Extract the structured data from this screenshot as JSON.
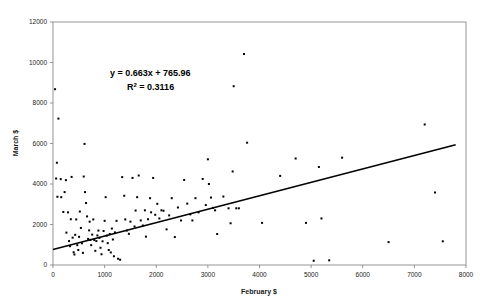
{
  "chart_data": {
    "type": "scatter",
    "title": "",
    "xlabel": "February $",
    "ylabel": "March $",
    "xlim": [
      0,
      8000
    ],
    "ylim": [
      0,
      12000
    ],
    "xticks": [
      0,
      1000,
      2000,
      3000,
      4000,
      5000,
      6000,
      7000,
      8000
    ],
    "yticks": [
      0,
      2000,
      4000,
      6000,
      8000,
      10000,
      12000
    ],
    "grid": false,
    "legend": "none",
    "annotations": {
      "equation": "y = 0.663x + 765.96",
      "r_squared_label": "R",
      "r_squared_exponent": "2",
      "r_squared_value": " = 0.3116"
    },
    "trendline": {
      "type": "linear",
      "slope": 0.663,
      "intercept": 765.96,
      "r_squared": 0.3116,
      "x_start": 0,
      "x_end": 7800
    },
    "marker": {
      "shape": "square",
      "color": "#000000",
      "size": 2
    },
    "points": [
      [
        40,
        8680
      ],
      [
        105,
        7230
      ],
      [
        75,
        5050
      ],
      [
        60,
        4270
      ],
      [
        85,
        3370
      ],
      [
        150,
        4240
      ],
      [
        160,
        3350
      ],
      [
        200,
        2620
      ],
      [
        225,
        3600
      ],
      [
        250,
        4190
      ],
      [
        260,
        1600
      ],
      [
        290,
        2600
      ],
      [
        310,
        1180
      ],
      [
        330,
        930
      ],
      [
        345,
        2260
      ],
      [
        360,
        4350
      ],
      [
        380,
        1350
      ],
      [
        400,
        630
      ],
      [
        415,
        520
      ],
      [
        430,
        1490
      ],
      [
        450,
        2250
      ],
      [
        470,
        980
      ],
      [
        490,
        740
      ],
      [
        505,
        1390
      ],
      [
        520,
        2640
      ],
      [
        540,
        1830
      ],
      [
        560,
        1070
      ],
      [
        580,
        600
      ],
      [
        595,
        4370
      ],
      [
        610,
        5980
      ],
      [
        620,
        3600
      ],
      [
        640,
        3060
      ],
      [
        660,
        2400
      ],
      [
        680,
        1290
      ],
      [
        700,
        1710
      ],
      [
        710,
        2140
      ],
      [
        725,
        1240
      ],
      [
        740,
        980
      ],
      [
        760,
        1500
      ],
      [
        780,
        2250
      ],
      [
        800,
        1230
      ],
      [
        820,
        700
      ],
      [
        840,
        1180
      ],
      [
        860,
        1460
      ],
      [
        880,
        1700
      ],
      [
        900,
        1340
      ],
      [
        920,
        850
      ],
      [
        940,
        530
      ],
      [
        960,
        1170
      ],
      [
        980,
        1680
      ],
      [
        1000,
        2180
      ],
      [
        1020,
        3350
      ],
      [
        1040,
        1450
      ],
      [
        1060,
        1080
      ],
      [
        1080,
        740
      ],
      [
        1100,
        1530
      ],
      [
        1120,
        620
      ],
      [
        1140,
        1800
      ],
      [
        1160,
        1260
      ],
      [
        1180,
        430
      ],
      [
        1200,
        1610
      ],
      [
        1230,
        2180
      ],
      [
        1260,
        310
      ],
      [
        1300,
        260
      ],
      [
        1340,
        4340
      ],
      [
        1380,
        3420
      ],
      [
        1400,
        2250
      ],
      [
        1430,
        1700
      ],
      [
        1470,
        1540
      ],
      [
        1500,
        2140
      ],
      [
        1540,
        4300
      ],
      [
        1580,
        1900
      ],
      [
        1600,
        2690
      ],
      [
        1630,
        3350
      ],
      [
        1660,
        4420
      ],
      [
        1700,
        2200
      ],
      [
        1740,
        1950
      ],
      [
        1780,
        2700
      ],
      [
        1800,
        1400
      ],
      [
        1840,
        2260
      ],
      [
        1880,
        3300
      ],
      [
        1900,
        2600
      ],
      [
        1940,
        4300
      ],
      [
        1980,
        2480
      ],
      [
        2020,
        3020
      ],
      [
        2060,
        2300
      ],
      [
        2100,
        2700
      ],
      [
        2140,
        2680
      ],
      [
        2200,
        1760
      ],
      [
        2250,
        2450
      ],
      [
        2300,
        3300
      ],
      [
        2360,
        1380
      ],
      [
        2420,
        2840
      ],
      [
        2480,
        2200
      ],
      [
        2540,
        4200
      ],
      [
        2600,
        3030
      ],
      [
        2660,
        2500
      ],
      [
        2700,
        2200
      ],
      [
        2760,
        3300
      ],
      [
        2820,
        2600
      ],
      [
        2900,
        4250
      ],
      [
        2960,
        2960
      ],
      [
        3000,
        5220
      ],
      [
        3020,
        4000
      ],
      [
        3060,
        3330
      ],
      [
        3100,
        2820
      ],
      [
        3140,
        2700
      ],
      [
        3180,
        1530
      ],
      [
        3300,
        3380
      ],
      [
        3400,
        2800
      ],
      [
        3440,
        2060
      ],
      [
        3480,
        4620
      ],
      [
        3500,
        8830
      ],
      [
        3550,
        2800
      ],
      [
        3600,
        2800
      ],
      [
        3700,
        10420
      ],
      [
        3760,
        6040
      ],
      [
        4050,
        2080
      ],
      [
        4400,
        4400
      ],
      [
        4700,
        5260
      ],
      [
        4900,
        2080
      ],
      [
        5050,
        210
      ],
      [
        5150,
        4840
      ],
      [
        5200,
        2300
      ],
      [
        5350,
        230
      ],
      [
        5600,
        5300
      ],
      [
        6500,
        1130
      ],
      [
        7200,
        6940
      ],
      [
        7400,
        3580
      ],
      [
        7550,
        1170
      ]
    ]
  }
}
